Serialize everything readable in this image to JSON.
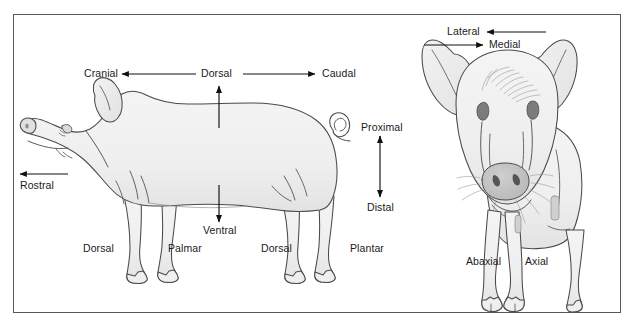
{
  "figure": {
    "kind": "veterinary-anatomy-directional-terms-diagram",
    "views": [
      "lateral",
      "frontal"
    ],
    "frame_color": "#555a5e",
    "body_fill": "#f0f0f0",
    "outline_color": "#4a4a4a",
    "text_color": "#1b1b1b"
  },
  "labels": {
    "cranial": "Cranial",
    "dorsal_top": "Dorsal",
    "caudal": "Caudal",
    "proximal": "Proximal",
    "distal": "Distal",
    "rostral": "Rostral",
    "ventral": "Ventral",
    "dorsal_fore": "Dorsal",
    "palmar": "Palmar",
    "dorsal_hind": "Dorsal",
    "plantar": "Plantar",
    "lateral": "Lateral",
    "medial": "Medial",
    "abaxial": "Abaxial",
    "axial": "Axial"
  },
  "arrows": [
    {
      "name": "cranial-arrow",
      "direction": "left",
      "from_label": "dorsal_top",
      "to_label": "cranial"
    },
    {
      "name": "caudal-arrow",
      "direction": "right",
      "from_label": "dorsal_top",
      "to_label": "caudal"
    },
    {
      "name": "dorsal-arrow",
      "direction": "up",
      "to_label": "dorsal_top"
    },
    {
      "name": "ventral-arrow",
      "direction": "down",
      "to_label": "ventral"
    },
    {
      "name": "rostral-arrow",
      "direction": "left",
      "to_label": "rostral"
    },
    {
      "name": "proximal-distal-arrow",
      "direction": "both-vertical",
      "to_label": "proximal"
    },
    {
      "name": "lateral-arrow",
      "direction": "left",
      "to_label": "lateral"
    },
    {
      "name": "medial-arrow",
      "direction": "right",
      "to_label": "medial"
    }
  ]
}
